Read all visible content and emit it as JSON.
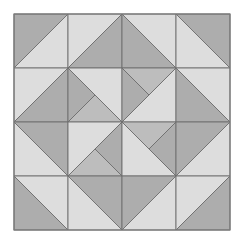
{
  "quilt": {
    "origin": [
      14,
      14
    ],
    "cell_size": 54,
    "rows": 4,
    "cols": 4,
    "colors": {
      "dark": "#adadad",
      "light": "#dddddd",
      "medium": "#bdbdbd",
      "line": "#6e6e6e",
      "border": "#7a7a7a"
    },
    "cells": [
      {
        "r": 0,
        "c": 0,
        "polys": [
          {
            "pts": "0,0 1,0 0,1",
            "fill": "dark"
          },
          {
            "pts": "1,0 1,1 0,1",
            "fill": "light"
          }
        ]
      },
      {
        "r": 0,
        "c": 1,
        "polys": [
          {
            "pts": "0,0 1,0 0,1",
            "fill": "light"
          },
          {
            "pts": "1,0 1,1 0,1",
            "fill": "dark"
          }
        ]
      },
      {
        "r": 0,
        "c": 2,
        "polys": [
          {
            "pts": "0,0 1,1 0,1",
            "fill": "dark"
          },
          {
            "pts": "0,0 1,0 1,1",
            "fill": "light"
          }
        ]
      },
      {
        "r": 0,
        "c": 3,
        "polys": [
          {
            "pts": "0,0 1,0 1,1",
            "fill": "dark"
          },
          {
            "pts": "0,0 1,1 0,1",
            "fill": "light"
          }
        ]
      },
      {
        "r": 1,
        "c": 0,
        "polys": [
          {
            "pts": "0,0 1,0 0,1",
            "fill": "light"
          },
          {
            "pts": "1,0 1,1 0,1",
            "fill": "dark"
          }
        ]
      },
      {
        "r": 1,
        "c": 1,
        "polys": [
          {
            "pts": "0,0 1,0 1,1",
            "fill": "light"
          },
          {
            "pts": "0,0 0.5,0.5 0,1",
            "fill": "dark"
          },
          {
            "pts": "0.5,0.5 1,1 0,1",
            "fill": "medium"
          }
        ]
      },
      {
        "r": 1,
        "c": 2,
        "polys": [
          {
            "pts": "1,0 1,1 0,1",
            "fill": "light"
          },
          {
            "pts": "0,0 1,0 0.5,0.5",
            "fill": "medium"
          },
          {
            "pts": "0,0 0.5,0.5 0,1",
            "fill": "dark"
          }
        ]
      },
      {
        "r": 1,
        "c": 3,
        "polys": [
          {
            "pts": "0,0 1,0 1,1",
            "fill": "light"
          },
          {
            "pts": "0,0 1,1 0,1",
            "fill": "dark"
          }
        ]
      },
      {
        "r": 2,
        "c": 0,
        "polys": [
          {
            "pts": "0,0 1,0 1,1",
            "fill": "dark"
          },
          {
            "pts": "0,0 1,1 0,1",
            "fill": "light"
          }
        ]
      },
      {
        "r": 2,
        "c": 1,
        "polys": [
          {
            "pts": "0,0 1,0 0,1",
            "fill": "light"
          },
          {
            "pts": "1,0 1,1 0.5,0.5",
            "fill": "dark"
          },
          {
            "pts": "0.5,0.5 1,1 0,1",
            "fill": "medium"
          }
        ]
      },
      {
        "r": 2,
        "c": 2,
        "polys": [
          {
            "pts": "0,0 1,1 0,1",
            "fill": "light"
          },
          {
            "pts": "0,0 1,0 0.5,0.5",
            "fill": "medium"
          },
          {
            "pts": "1,0 1,1 0.5,0.5",
            "fill": "dark"
          }
        ]
      },
      {
        "r": 2,
        "c": 3,
        "polys": [
          {
            "pts": "0,0 1,0 0,1",
            "fill": "dark"
          },
          {
            "pts": "1,0 1,1 0,1",
            "fill": "light"
          }
        ]
      },
      {
        "r": 3,
        "c": 0,
        "polys": [
          {
            "pts": "0,0 1,0 1,1",
            "fill": "light"
          },
          {
            "pts": "0,0 1,1 0,1",
            "fill": "dark"
          }
        ]
      },
      {
        "r": 3,
        "c": 1,
        "polys": [
          {
            "pts": "0,0 1,0 1,1",
            "fill": "dark"
          },
          {
            "pts": "0,0 1,1 0,1",
            "fill": "light"
          }
        ]
      },
      {
        "r": 3,
        "c": 2,
        "polys": [
          {
            "pts": "0,0 1,0 0,1",
            "fill": "dark"
          },
          {
            "pts": "1,0 1,1 0,1",
            "fill": "light"
          }
        ]
      },
      {
        "r": 3,
        "c": 3,
        "polys": [
          {
            "pts": "0,0 1,0 0,1",
            "fill": "light"
          },
          {
            "pts": "1,0 1,1 0,1",
            "fill": "dark"
          }
        ]
      }
    ]
  }
}
